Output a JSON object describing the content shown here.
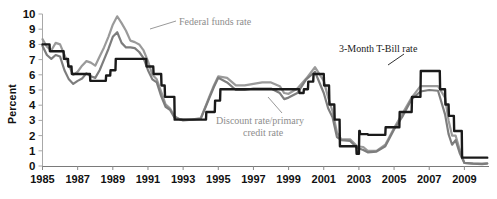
{
  "chart_data": {
    "type": "line",
    "title": "",
    "xlabel": "",
    "ylabel": "Percent",
    "xlim": [
      1985,
      2010.4
    ],
    "ylim": [
      0,
      10
    ],
    "grid": false,
    "legend_position": "inline-annotations",
    "y_ticks": [
      "0",
      "1",
      "2",
      "3",
      "4",
      "5",
      "6",
      "7",
      "8",
      "9",
      "10"
    ],
    "x_ticks": [
      "1985",
      "1987",
      "1989",
      "1991",
      "1993",
      "1995",
      "1997",
      "1999",
      "2001",
      "2003",
      "2005",
      "2007",
      "2009"
    ],
    "x_tick_values": [
      1985,
      1987,
      1989,
      1991,
      1993,
      1995,
      1997,
      1999,
      2001,
      2003,
      2005,
      2007,
      2009
    ],
    "annotations": [
      {
        "name": "federal-funds-rate",
        "text": "Federal funds rate",
        "color": "#8d8d8d"
      },
      {
        "name": "discount-rate",
        "text": "Discount rate/primary",
        "text2": "credit rate",
        "color": "#8d8d8d"
      },
      {
        "name": "tbill-rate",
        "text": "3-Month T-Bill rate",
        "color": "#1a1a1a"
      }
    ],
    "colors": {
      "federal_funds": "#9a9a9a",
      "discount": "#1a1a1a",
      "tbill": "#7d7d7d"
    },
    "series": [
      {
        "name": "Federal funds rate",
        "color": "#9a9a9a",
        "x": [
          1985.0,
          1985.25,
          1985.5,
          1985.75,
          1986.0,
          1986.25,
          1986.5,
          1986.75,
          1987.0,
          1987.25,
          1987.5,
          1987.75,
          1988.0,
          1988.25,
          1988.5,
          1988.75,
          1989.0,
          1989.25,
          1989.5,
          1989.75,
          1990.0,
          1990.25,
          1990.5,
          1990.75,
          1991.0,
          1991.25,
          1991.5,
          1991.75,
          1992.0,
          1992.25,
          1992.5,
          1992.75,
          1993.0,
          1993.5,
          1994.0,
          1994.25,
          1994.5,
          1994.75,
          1995.0,
          1995.5,
          1996.0,
          1996.5,
          1997.0,
          1997.5,
          1998.0,
          1998.5,
          1998.75,
          1999.0,
          1999.5,
          2000.0,
          2000.5,
          2001.0,
          2001.25,
          2001.5,
          2001.75,
          2002.0,
          2002.5,
          2002.9,
          2003.25,
          2003.5,
          2004.0,
          2004.5,
          2005.0,
          2005.5,
          2006.0,
          2006.5,
          2007.0,
          2007.5,
          2007.9,
          2008.1,
          2008.3,
          2008.5,
          2008.75,
          2009.0,
          2009.5,
          2010.0,
          2010.3
        ],
        "y": [
          8.35,
          7.85,
          7.6,
          8.1,
          8.0,
          7.3,
          6.6,
          6.0,
          6.2,
          6.6,
          6.9,
          6.8,
          6.6,
          7.2,
          7.8,
          8.5,
          9.3,
          9.85,
          9.4,
          8.9,
          8.25,
          8.15,
          8.0,
          7.6,
          6.9,
          6.0,
          5.7,
          4.9,
          4.05,
          3.8,
          3.3,
          3.1,
          3.05,
          3.05,
          3.15,
          3.85,
          4.6,
          5.3,
          5.9,
          5.8,
          5.3,
          5.3,
          5.4,
          5.5,
          5.5,
          5.25,
          4.8,
          4.75,
          5.1,
          5.75,
          6.5,
          5.6,
          4.5,
          3.6,
          2.2,
          1.75,
          1.75,
          1.3,
          1.25,
          1.0,
          1.0,
          1.4,
          2.5,
          3.5,
          4.5,
          5.25,
          5.25,
          5.25,
          4.5,
          3.0,
          2.0,
          2.0,
          1.0,
          0.2,
          0.15,
          0.15,
          0.18
        ]
      },
      {
        "name": "3-Month T-Bill rate",
        "color": "#7d7d7d",
        "x": [
          1985.0,
          1985.25,
          1985.5,
          1985.75,
          1986.0,
          1986.25,
          1986.5,
          1986.75,
          1987.0,
          1987.25,
          1987.5,
          1987.75,
          1988.0,
          1988.25,
          1988.5,
          1988.75,
          1989.0,
          1989.25,
          1989.5,
          1989.75,
          1990.0,
          1990.25,
          1990.5,
          1990.75,
          1991.0,
          1991.25,
          1991.5,
          1991.75,
          1992.0,
          1992.25,
          1992.5,
          1992.75,
          1993.0,
          1993.5,
          1994.0,
          1994.25,
          1994.5,
          1994.75,
          1995.0,
          1995.5,
          1996.0,
          1996.5,
          1997.0,
          1997.5,
          1998.0,
          1998.5,
          1998.75,
          1999.0,
          1999.5,
          2000.0,
          2000.5,
          2001.0,
          2001.25,
          2001.5,
          2001.75,
          2002.0,
          2002.5,
          2002.9,
          2003.25,
          2003.5,
          2004.0,
          2004.5,
          2005.0,
          2005.5,
          2006.0,
          2006.5,
          2007.0,
          2007.5,
          2007.9,
          2008.1,
          2008.3,
          2008.5,
          2008.75,
          2009.0,
          2009.5,
          2010.0,
          2010.3
        ],
        "y": [
          7.9,
          7.3,
          7.05,
          7.3,
          7.2,
          6.3,
          5.7,
          5.4,
          5.6,
          5.75,
          6.1,
          5.9,
          5.8,
          6.3,
          7.0,
          7.7,
          8.5,
          8.8,
          8.1,
          7.8,
          7.8,
          7.75,
          7.5,
          7.1,
          6.3,
          5.7,
          5.5,
          4.6,
          3.9,
          3.7,
          3.2,
          3.1,
          3.0,
          3.05,
          3.1,
          3.8,
          4.5,
          5.2,
          5.8,
          5.5,
          5.0,
          5.0,
          5.1,
          5.1,
          5.1,
          4.8,
          4.4,
          4.5,
          4.8,
          5.7,
          6.2,
          4.8,
          3.8,
          3.2,
          1.9,
          1.7,
          1.65,
          1.2,
          1.05,
          0.9,
          0.95,
          1.3,
          2.4,
          3.3,
          4.4,
          4.9,
          5.0,
          4.95,
          3.4,
          2.1,
          1.4,
          1.7,
          0.8,
          0.2,
          0.15,
          0.12,
          0.15
        ]
      },
      {
        "name": "Discount rate/primary credit rate",
        "color": "#1a1a1a",
        "x": [
          1985.0,
          1985.4,
          1985.42,
          1986.2,
          1986.22,
          1986.45,
          1986.47,
          1986.65,
          1986.67,
          1987.7,
          1987.72,
          1988.6,
          1988.62,
          1988.85,
          1988.87,
          1989.15,
          1989.17,
          1990.9,
          1990.92,
          1991.3,
          1991.32,
          1991.75,
          1991.77,
          1991.95,
          1991.97,
          1992.5,
          1992.52,
          1994.3,
          1994.32,
          1994.8,
          1994.82,
          1995.1,
          1995.12,
          1996.05,
          1996.07,
          1999.6,
          1999.62,
          1999.85,
          1999.87,
          2000.1,
          2000.12,
          2000.4,
          2000.42,
          2001.0,
          2001.02,
          2001.3,
          2001.32,
          2001.6,
          2001.62,
          2001.9,
          2001.92,
          2002.85,
          2002.87,
          2003.0,
          2003.02,
          2003.05,
          2003.07,
          2003.5,
          2003.52,
          2004.5,
          2004.52,
          2005.3,
          2005.32,
          2006.0,
          2006.02,
          2006.5,
          2006.52,
          2007.6,
          2007.62,
          2007.9,
          2007.92,
          2008.1,
          2008.12,
          2008.4,
          2008.42,
          2008.85,
          2008.87,
          2009.8,
          2009.82,
          2010.3
        ],
        "y": [
          8.0,
          8.0,
          7.55,
          7.55,
          7.05,
          7.05,
          6.55,
          6.55,
          6.05,
          6.05,
          5.6,
          5.6,
          5.95,
          5.95,
          6.3,
          6.3,
          7.05,
          7.05,
          6.55,
          6.55,
          6.05,
          6.05,
          5.3,
          5.3,
          4.55,
          4.55,
          3.05,
          3.05,
          3.55,
          3.55,
          4.3,
          4.3,
          5.05,
          5.05,
          5.05,
          5.05,
          4.8,
          4.8,
          5.05,
          5.05,
          5.55,
          5.55,
          6.05,
          6.05,
          5.3,
          5.3,
          4.05,
          4.05,
          3.05,
          3.05,
          1.3,
          1.3,
          0.8,
          0.8,
          2.3,
          2.3,
          2.1,
          2.1,
          2.05,
          2.05,
          2.55,
          2.55,
          3.55,
          3.55,
          4.55,
          4.55,
          6.25,
          6.25,
          5.05,
          5.05,
          4.05,
          4.05,
          3.3,
          3.3,
          2.3,
          2.3,
          0.55,
          0.55,
          0.55,
          0.55
        ]
      }
    ]
  },
  "annotation_text": {
    "federal_funds": "Federal funds rate",
    "discount_line1": "Discount rate/primary",
    "discount_line2": "credit rate",
    "tbill": "3-Month T-Bill rate"
  },
  "axis": {
    "y_title": "Percent"
  }
}
